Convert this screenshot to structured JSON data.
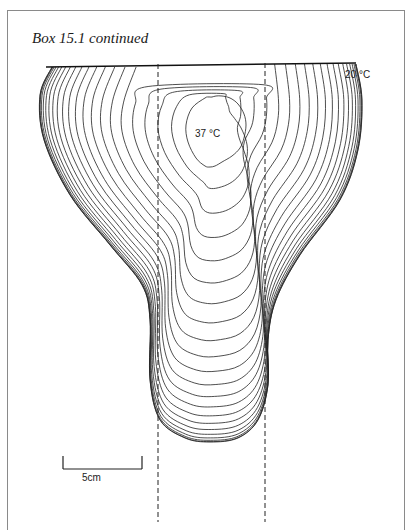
{
  "box": {
    "title": "Box 15.1 continued"
  },
  "figure": {
    "type": "isotherm contour diagram",
    "surface_label": "20 °C",
    "core_label": "37 °C",
    "contour_count": 22,
    "scale_bar": {
      "label": "5cm"
    },
    "guide_lines": {
      "style": "dashed",
      "count": 2
    }
  }
}
